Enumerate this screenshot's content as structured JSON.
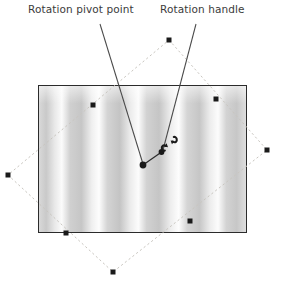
{
  "figure": {
    "width": 295,
    "height": 304,
    "background": "#ffffff"
  },
  "annotations": [
    {
      "id": "pivot",
      "label": "Rotation pivot point",
      "leader_from": [
        100,
        22
      ],
      "leader_to": [
        143,
        165
      ]
    },
    {
      "id": "handle",
      "label": "Rotation handle",
      "leader_from": [
        196,
        22
      ],
      "leader_to": [
        160,
        152
      ]
    }
  ],
  "labels": {
    "rotation_pivot_point": "Rotation pivot point",
    "rotation_handle": "Rotation handle"
  },
  "credit": {
    "text": "Source: Corel® Corporation. ©2013 Cengage Learning®. All Rights Reserved.",
    "orientation": "vertical",
    "color": "#555555"
  },
  "picture": {
    "name": "vertical-blinds-photo",
    "x": 38,
    "y": 85,
    "width": 209,
    "height": 148,
    "border_color": "#2b2b2b",
    "description": "Photograph of vertical blinds with alternating gray and white stripes",
    "stripes": [
      {
        "offset": 0.0,
        "color": "#d9d9d9"
      },
      {
        "offset": 0.035,
        "color": "#c9c9c9"
      },
      {
        "offset": 0.075,
        "color": "#e8e8e8"
      },
      {
        "offset": 0.11,
        "color": "#fbfbfb"
      },
      {
        "offset": 0.15,
        "color": "#d0d0d0"
      },
      {
        "offset": 0.205,
        "color": "#c6c6c6"
      },
      {
        "offset": 0.255,
        "color": "#efefef"
      },
      {
        "offset": 0.29,
        "color": "#fdfdfd"
      },
      {
        "offset": 0.33,
        "color": "#d4d4d4"
      },
      {
        "offset": 0.39,
        "color": "#c4c4c4"
      },
      {
        "offset": 0.44,
        "color": "#ebebeb"
      },
      {
        "offset": 0.48,
        "color": "#fcfcfc"
      },
      {
        "offset": 0.52,
        "color": "#d2d2d2"
      },
      {
        "offset": 0.58,
        "color": "#c5c5c5"
      },
      {
        "offset": 0.635,
        "color": "#ededed"
      },
      {
        "offset": 0.675,
        "color": "#fdfdfd"
      },
      {
        "offset": 0.715,
        "color": "#d5d5d5"
      },
      {
        "offset": 0.775,
        "color": "#c6c6c6"
      },
      {
        "offset": 0.825,
        "color": "#ececec"
      },
      {
        "offset": 0.865,
        "color": "#fcfcfc"
      },
      {
        "offset": 0.905,
        "color": "#d3d3d3"
      },
      {
        "offset": 0.955,
        "color": "#c7c7c7"
      },
      {
        "offset": 1.0,
        "color": "#dedede"
      }
    ]
  },
  "selection": {
    "bounding_box_style": "dashed",
    "bounding_box_color": "#c9c6c0",
    "vertices": [
      [
        169,
        40
      ],
      [
        267,
        150
      ],
      [
        113,
        272
      ],
      [
        8,
        175
      ]
    ],
    "handle_color": "#1a1a1a",
    "handle_size": 5,
    "handles": [
      {
        "name": "handle-top",
        "x": 169,
        "y": 40
      },
      {
        "name": "handle-top-right",
        "x": 216,
        "y": 99
      },
      {
        "name": "handle-right",
        "x": 267,
        "y": 150
      },
      {
        "name": "handle-bottom-right",
        "x": 190,
        "y": 221
      },
      {
        "name": "handle-bottom",
        "x": 113,
        "y": 272
      },
      {
        "name": "handle-bottom-left",
        "x": 66,
        "y": 233
      },
      {
        "name": "handle-left",
        "x": 8,
        "y": 175
      },
      {
        "name": "handle-top-left",
        "x": 93,
        "y": 105
      }
    ]
  },
  "rotation": {
    "pivot_point": {
      "x": 143,
      "y": 165,
      "radius": 3.4,
      "color": "#1a1a1a"
    },
    "handle": {
      "x": 161,
      "y": 152,
      "radius": 2.8,
      "color": "#1a1a1a"
    },
    "arm_color": "#2a2a2a",
    "cursor_icon": "rotate-cursor",
    "cursor_position": {
      "x": 170,
      "y": 143
    }
  },
  "colors": {
    "label_text": "#3b3b3b",
    "leader_line": "#4a4a4a",
    "frame_border": "#2b2b2b",
    "dashed_box": "#c9c6c0",
    "marker": "#1a1a1a"
  }
}
